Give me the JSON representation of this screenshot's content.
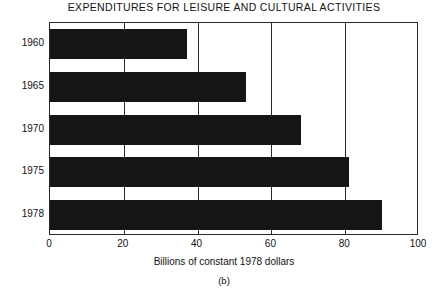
{
  "chart_data": {
    "type": "bar",
    "orientation": "horizontal",
    "title": "EXPENDITURES FOR LEISURE AND CULTURAL ACTIVITIES",
    "xlabel": "Billions of constant 1978 dollars",
    "ylabel": "",
    "caption": "(b)",
    "categories": [
      "1960",
      "1965",
      "1970",
      "1975",
      "1978"
    ],
    "values": [
      37,
      53,
      68,
      81,
      90
    ],
    "xlim": [
      0,
      100
    ],
    "xticks": [
      "0",
      "20",
      "40",
      "60",
      "80",
      "100"
    ],
    "xtick_values": [
      0,
      20,
      40,
      60,
      80,
      100
    ],
    "gridlines": [
      20,
      40,
      60,
      80
    ],
    "grid": true,
    "legend": null,
    "bar_color": "#151515",
    "frame_color": "#2a2a2a",
    "background": "#ffffff"
  }
}
